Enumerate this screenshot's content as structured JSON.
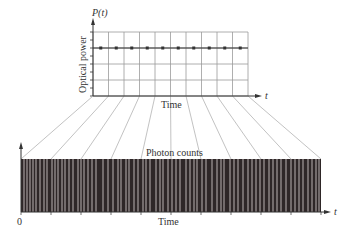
{
  "top_chart": {
    "y_axis_symbol": "P(t)",
    "y_axis_label": "Optical power",
    "x_axis_label": "Time",
    "x_axis_symbol": "t",
    "constant_power_level_row": 1,
    "sample_points_count": 10
  },
  "bottom_chart": {
    "title": "Photon counts",
    "x_axis_label": "Time",
    "x_axis_symbol": "t",
    "origin_label": "0",
    "photon_line_x": [
      24,
      27,
      30,
      33,
      36,
      40,
      44,
      47,
      52,
      55,
      58,
      62,
      65,
      69,
      73,
      78,
      81,
      84,
      88,
      92,
      96,
      103,
      108,
      113,
      118,
      121,
      126,
      129,
      134,
      138,
      143,
      146,
      150,
      156,
      160,
      163,
      168,
      172,
      176,
      180,
      186,
      190,
      194,
      197,
      202,
      206,
      212,
      217,
      221,
      224,
      230,
      234,
      238,
      243,
      248,
      252,
      256,
      260,
      264,
      269,
      273,
      277,
      281,
      286,
      291,
      295,
      299,
      303,
      308,
      312,
      316,
      319
    ]
  },
  "colors": {
    "axis": "#333333",
    "grid": "#9a9a9a",
    "bar_fill": "#2e2627",
    "photon_line": "#c9c2c2",
    "fan_line": "#a8a8a8",
    "dot": "#333333"
  },
  "chart_data": {
    "type": "diagram",
    "panels": [
      {
        "name": "Optical power",
        "type": "line",
        "xlabel": "Time",
        "ylabel": "Optical power",
        "y_symbol": "P(t)",
        "x": [
          1,
          2,
          3,
          4,
          5,
          6,
          7,
          8,
          9,
          10
        ],
        "values": [
          3,
          3,
          3,
          3,
          3,
          3,
          3,
          3,
          3,
          3
        ],
        "grid": true
      },
      {
        "name": "Photon counts",
        "type": "event-raster",
        "xlabel": "Time",
        "origin": "0"
      }
    ]
  }
}
